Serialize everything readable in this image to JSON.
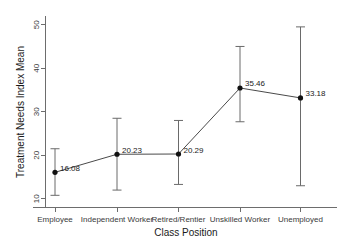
{
  "chart_data": {
    "type": "line",
    "title": "",
    "subtitle": "",
    "xlabel": "Class Position",
    "ylabel": "Treatment Needs Index Mean",
    "categories": [
      "Employee",
      "Independent Worker",
      "Retired/Rentier",
      "Unskilled Worker",
      "Unemployed"
    ],
    "values": [
      16.08,
      20.23,
      20.29,
      35.46,
      33.18
    ],
    "value_labels": [
      "16.08",
      "20.23",
      "20.29",
      "35.46",
      "33.18"
    ],
    "error_low": [
      10.8,
      12.0,
      13.3,
      27.7,
      13.0
    ],
    "error_high": [
      21.5,
      28.5,
      28.0,
      45.0,
      49.5
    ],
    "ylim": [
      8.0,
      52.0
    ],
    "yticks": [
      10,
      20,
      30,
      40,
      50
    ],
    "ytick_labels": [
      "10",
      "20",
      "30",
      "40",
      "50"
    ],
    "grid": false,
    "legend": "none",
    "marker": "filled-circle",
    "errorbar_style": "capped-whisker",
    "colors": {
      "line": "#4a4a4a",
      "marker": "#111111",
      "errorbar": "#6a6a6a",
      "axis": "#6d6d6d",
      "text": "#1a1a1a",
      "background": "#ffffff"
    }
  }
}
